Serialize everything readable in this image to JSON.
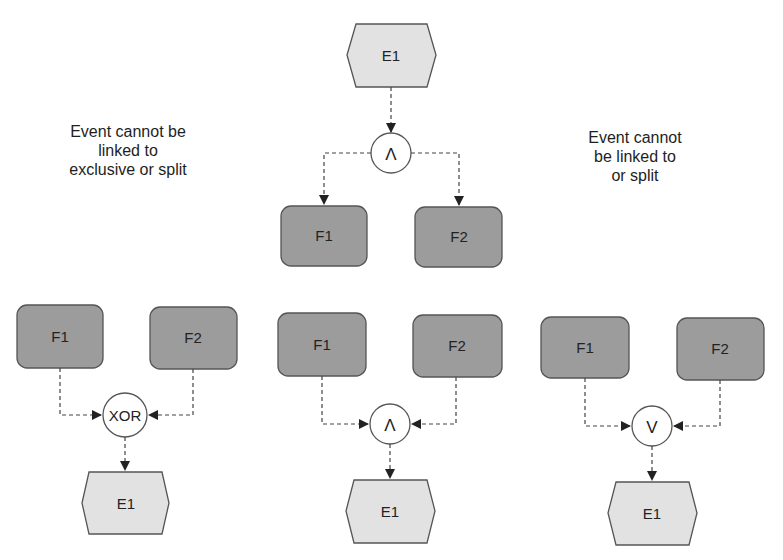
{
  "colors": {
    "function_fill": "#9c9c9c",
    "function_stroke": "#555555",
    "event_fill": "#e2e2e2",
    "event_stroke": "#555555",
    "gate_fill": "#ffffff",
    "connector": "#444444",
    "text": "#222222"
  },
  "notes": {
    "left": [
      "Event cannot be",
      "linked to",
      "exclusive or split"
    ],
    "right": [
      "Event cannot",
      "be linked to",
      "or split"
    ]
  },
  "diagrams": [
    {
      "id": "top-and-split",
      "event": "E1",
      "gate": "Λ",
      "gate_type": "AND",
      "functions": [
        "F1",
        "F2"
      ],
      "direction": "event-to-functions"
    },
    {
      "id": "bottom-left-xor-join",
      "event": "E1",
      "gate": "XOR",
      "gate_type": "XOR",
      "functions": [
        "F1",
        "F2"
      ],
      "direction": "functions-to-event"
    },
    {
      "id": "bottom-middle-and-join",
      "event": "E1",
      "gate": "Λ",
      "gate_type": "AND",
      "functions": [
        "F1",
        "F2"
      ],
      "direction": "functions-to-event"
    },
    {
      "id": "bottom-right-or-join",
      "event": "E1",
      "gate": "V",
      "gate_type": "OR",
      "functions": [
        "F1",
        "F2"
      ],
      "direction": "functions-to-event"
    }
  ]
}
